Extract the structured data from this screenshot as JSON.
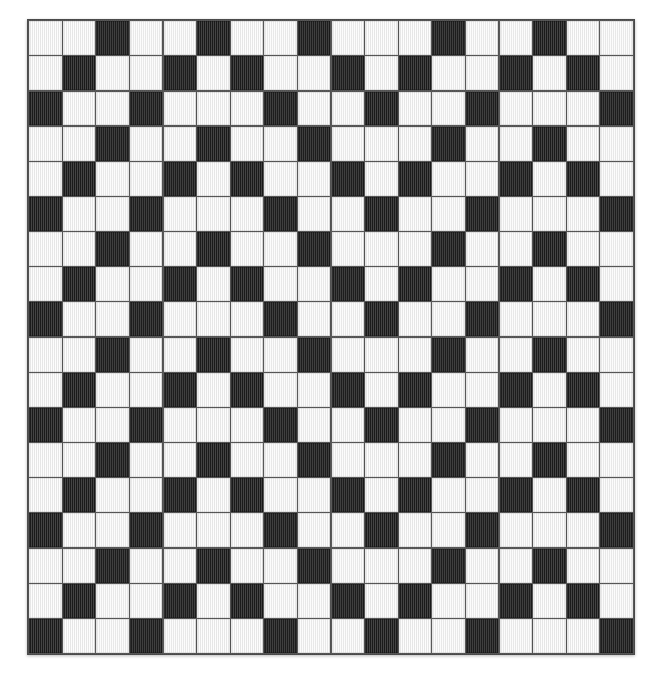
{
  "image": {
    "title": "Checkerboard Weave Pattern Swatch",
    "kind": "texture-swatch",
    "background_color": "#ffffff"
  },
  "panel": {
    "x": 27,
    "y": 19,
    "width": 608,
    "height": 636,
    "border_color": "#4a4a4a",
    "grout_color": "#555555",
    "shadow": "0 1px 3px rgba(0,0,0,0.28)"
  },
  "colors": {
    "light_tile": "#f3f3f3",
    "dark_tile": "#2f2f2f",
    "page_background": "#ffffff",
    "grid_line": "#555555"
  },
  "grid": {
    "columns": 18,
    "rows": 18,
    "cell_size_px": 33.7,
    "legend": {
      "0": "light",
      "1": "dark"
    },
    "matrix": [
      [
        0,
        0,
        1,
        0,
        0,
        1,
        0,
        0,
        1,
        0,
        0,
        0,
        1,
        0,
        0,
        1,
        0,
        0
      ],
      [
        0,
        1,
        0,
        0,
        1,
        0,
        1,
        0,
        0,
        1,
        0,
        1,
        0,
        0,
        1,
        0,
        1,
        0
      ],
      [
        1,
        0,
        0,
        1,
        0,
        0,
        0,
        1,
        0,
        0,
        1,
        0,
        0,
        1,
        0,
        0,
        0,
        1
      ],
      [
        0,
        0,
        1,
        0,
        0,
        1,
        0,
        0,
        1,
        0,
        0,
        0,
        1,
        0,
        0,
        1,
        0,
        0
      ],
      [
        0,
        1,
        0,
        0,
        1,
        0,
        1,
        0,
        0,
        1,
        0,
        1,
        0,
        0,
        1,
        0,
        1,
        0
      ],
      [
        1,
        0,
        0,
        1,
        0,
        0,
        0,
        1,
        0,
        0,
        1,
        0,
        0,
        1,
        0,
        0,
        0,
        1
      ],
      [
        0,
        0,
        1,
        0,
        0,
        1,
        0,
        0,
        1,
        0,
        0,
        0,
        1,
        0,
        0,
        1,
        0,
        0
      ],
      [
        0,
        1,
        0,
        0,
        1,
        0,
        1,
        0,
        0,
        1,
        0,
        1,
        0,
        0,
        1,
        0,
        1,
        0
      ],
      [
        1,
        0,
        0,
        1,
        0,
        0,
        0,
        1,
        0,
        0,
        1,
        0,
        0,
        1,
        0,
        0,
        0,
        1
      ],
      [
        0,
        0,
        1,
        0,
        0,
        1,
        0,
        0,
        1,
        0,
        0,
        0,
        1,
        0,
        0,
        1,
        0,
        0
      ],
      [
        0,
        1,
        0,
        0,
        1,
        0,
        1,
        0,
        0,
        1,
        0,
        1,
        0,
        0,
        1,
        0,
        1,
        0
      ],
      [
        1,
        0,
        0,
        1,
        0,
        0,
        0,
        1,
        0,
        0,
        1,
        0,
        0,
        1,
        0,
        0,
        0,
        1
      ],
      [
        0,
        0,
        1,
        0,
        0,
        1,
        0,
        0,
        1,
        0,
        0,
        0,
        1,
        0,
        0,
        1,
        0,
        0
      ],
      [
        0,
        1,
        0,
        0,
        1,
        0,
        1,
        0,
        0,
        1,
        0,
        1,
        0,
        0,
        1,
        0,
        1,
        0
      ],
      [
        1,
        0,
        0,
        1,
        0,
        0,
        0,
        1,
        0,
        0,
        1,
        0,
        0,
        1,
        0,
        0,
        0,
        1
      ],
      [
        0,
        0,
        1,
        0,
        0,
        1,
        0,
        0,
        1,
        0,
        0,
        0,
        1,
        0,
        0,
        1,
        0,
        0
      ],
      [
        0,
        1,
        0,
        0,
        1,
        0,
        1,
        0,
        0,
        1,
        0,
        1,
        0,
        0,
        1,
        0,
        1,
        0
      ],
      [
        1,
        0,
        0,
        1,
        0,
        0,
        0,
        1,
        0,
        0,
        1,
        0,
        0,
        1,
        0,
        0,
        0,
        1
      ]
    ]
  }
}
